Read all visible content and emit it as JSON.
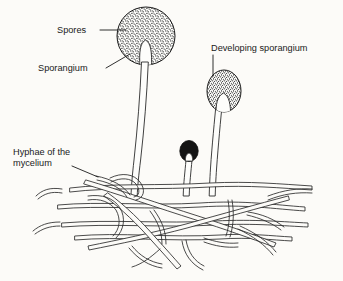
{
  "figure": {
    "type": "line-drawing",
    "background_color": "#fcfbf8",
    "ink_color": "#1a1a1a",
    "width": 343,
    "height": 281
  },
  "labels": [
    {
      "id": "spores",
      "text": "Spores",
      "x": 57,
      "y": 33,
      "leader": "horizontal line running right to the stippled sporangium head"
    },
    {
      "id": "sporangium",
      "text": "Sporangium",
      "x": 38,
      "y": 71,
      "leader": "diagonal line running up-right to the lower-left edge of the sporangium"
    },
    {
      "id": "developing-sporangium",
      "text": "Developing sporangium",
      "x": 211,
      "y": 51,
      "leader": "vertical line running down to the smaller stippled sporangium"
    },
    {
      "id": "hyphae-of-the-mycelium",
      "text_line1": "Hyphae of the",
      "text_line2": "mycelium",
      "x": 13,
      "y": 155,
      "leader": "diagonal line running down-right into the tangled hyphal mat"
    }
  ],
  "structures": [
    {
      "id": "mature-sporangium",
      "name": "Mature sporangium",
      "description": "Large stippled spherical head filled with spores, with a pale columella notch at its base",
      "fill": "stipple",
      "center_x": 146,
      "center_y": 36,
      "radius": 29
    },
    {
      "id": "mature-sporangiophore",
      "name": "Sporangiophore (stalk)",
      "description": "Long slightly wavy tubular stalk connecting the mature sporangium to the mycelium"
    },
    {
      "id": "developing-sporangium-body",
      "name": "Developing sporangium",
      "description": "Smaller oval stippled sporangium flaring into its stalk",
      "fill": "stipple",
      "center_x": 224,
      "center_y": 92,
      "radius": 17
    },
    {
      "id": "young-sporangium",
      "name": "Young sporangium",
      "description": "Small solid dark knob on a short stalk, earliest developmental stage",
      "fill": "solid-dark",
      "center_x": 189,
      "center_y": 152,
      "radius": 9
    },
    {
      "id": "mycelium",
      "name": "Hyphae of the mycelium",
      "description": "Dense horizontal tangle of branching tubular hyphae drawn as thin double lines"
    }
  ]
}
